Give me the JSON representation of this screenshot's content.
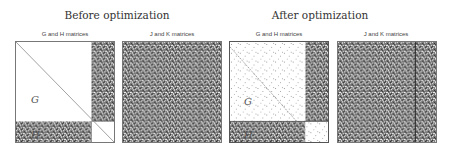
{
  "groups": [
    {
      "title": "Before optimization",
      "panels": [
        {
          "title": "G and H matrices",
          "labels": {
            "g": "G",
            "h": "H"
          }
        },
        {
          "title": "J and K matrices"
        }
      ]
    },
    {
      "title": "After optimization",
      "panels": [
        {
          "title": "G and H matrices",
          "labels": {
            "g": "G",
            "h": "H"
          }
        },
        {
          "title": "J and K matrices"
        }
      ]
    }
  ],
  "colors": {
    "noise_dark": "#3a3a3a",
    "noise_light": "#d8d8d8",
    "border": "#777777",
    "diagonal": "#888888"
  }
}
